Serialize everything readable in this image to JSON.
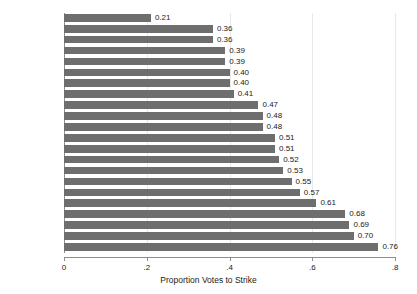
{
  "chart_data": {
    "type": "bar",
    "orientation": "horizontal",
    "title": "",
    "xlabel": "Proportion Votes to Strike",
    "ylabel": "",
    "xlim": [
      0,
      0.8
    ],
    "xticks": [
      "0",
      ".2",
      ".4",
      ".6",
      ".8"
    ],
    "xtick_values": [
      0,
      0.2,
      0.4,
      0.6,
      0.8
    ],
    "grid": true,
    "legend": null,
    "bar_color": "#6e6e6e",
    "categories": [
      "Rehnquist",
      "Harlan",
      "Frankfurter",
      "Scalia",
      "Burger",
      "Thomas",
      "Clark",
      "O'Connor",
      "Black",
      "White",
      "Kennedy",
      "Stewart",
      "Powell",
      "Warren",
      "Breyer",
      "Ginsburg",
      "Blackmun",
      "Souter",
      "Stevens",
      "Douglas",
      "Brennan",
      "Marshall"
    ],
    "values": [
      0.21,
      0.36,
      0.36,
      0.39,
      0.39,
      0.4,
      0.4,
      0.41,
      0.47,
      0.48,
      0.48,
      0.51,
      0.51,
      0.52,
      0.53,
      0.55,
      0.57,
      0.61,
      0.68,
      0.69,
      0.7,
      0.76
    ],
    "value_labels": [
      "0.21",
      "0.36",
      "0.36",
      "0.39",
      "0.39",
      "0.40",
      "0.40",
      "0.41",
      "0.47",
      "0.48",
      "0.48",
      "0.51",
      "0.51",
      "0.52",
      "0.53",
      "0.55",
      "0.57",
      "0.61",
      "0.68",
      "0.69",
      "0.70",
      "0.76"
    ]
  }
}
